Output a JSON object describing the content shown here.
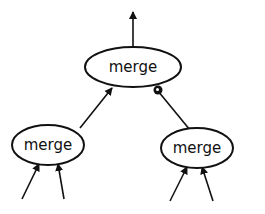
{
  "diagram": {
    "type": "tree",
    "nodes": [
      {
        "id": "top",
        "label": "merge",
        "cx": 133,
        "cy": 67,
        "rx": 48,
        "ry": 20
      },
      {
        "id": "left",
        "label": "merge",
        "cx": 48,
        "cy": 145,
        "rx": 36,
        "ry": 20
      },
      {
        "id": "right",
        "label": "merge",
        "cx": 197,
        "cy": 148,
        "rx": 36,
        "ry": 20
      }
    ],
    "edges": [
      {
        "from": "top",
        "to": "output",
        "label": ""
      },
      {
        "from": "left",
        "to": "top",
        "label": ""
      },
      {
        "from": "right",
        "to": "top",
        "label": "",
        "marker": "filled-circle"
      },
      {
        "from": "input",
        "to": "left",
        "label": ""
      },
      {
        "from": "input",
        "to": "left",
        "label": ""
      },
      {
        "from": "input",
        "to": "right",
        "label": ""
      },
      {
        "from": "input",
        "to": "right",
        "label": ""
      }
    ],
    "colors": {
      "stroke": "#111111",
      "background": "#ffffff"
    }
  }
}
